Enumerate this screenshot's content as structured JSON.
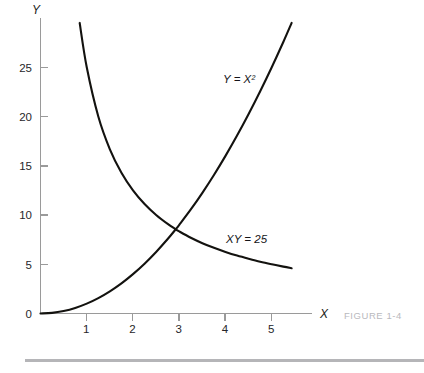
{
  "caption": "FIGURE 1-4",
  "axes": {
    "x_name": "X",
    "y_name": "Y",
    "x_ticks": [
      "1",
      "2",
      "3",
      "4",
      "5"
    ],
    "y_ticks": [
      "0",
      "5",
      "10",
      "15",
      "20",
      "25"
    ]
  },
  "annotations": {
    "parabola_label": "Y = X²",
    "hyperbola_label": "XY = 25"
  },
  "colors": {
    "curve": "#13120f",
    "axis": "#9a9a9a",
    "caption": "#b9b9bd",
    "rule": "#b5b5b8",
    "background": "#ffffff"
  },
  "chart_data": {
    "type": "line",
    "title": "",
    "subtitle": "",
    "xlabel": "X",
    "ylabel": "Y",
    "xlim": [
      0,
      5.9
    ],
    "ylim": [
      0,
      30
    ],
    "grid": false,
    "legend": "inline-annotations",
    "xticks": [
      1,
      2,
      3,
      4,
      5
    ],
    "yticks": [
      0,
      5,
      10,
      15,
      20,
      25
    ],
    "annotations": [
      {
        "text": "Y = X²",
        "x": 3.95,
        "y": 25.0
      },
      {
        "text": "XY = 25",
        "x": 4.05,
        "y": 7.4
      }
    ],
    "intersection": {
      "x": 2.924,
      "y": 8.55
    },
    "series": [
      {
        "name": "Y = X²",
        "equation": "y = x^2",
        "x_range": [
          0.0,
          5.43
        ],
        "points": [
          {
            "x": 0.0,
            "y": 0.0
          },
          {
            "x": 0.25,
            "y": 0.06
          },
          {
            "x": 0.5,
            "y": 0.25
          },
          {
            "x": 0.75,
            "y": 0.56
          },
          {
            "x": 1.0,
            "y": 1.0
          },
          {
            "x": 1.25,
            "y": 1.56
          },
          {
            "x": 1.5,
            "y": 2.25
          },
          {
            "x": 1.75,
            "y": 3.06
          },
          {
            "x": 2.0,
            "y": 4.0
          },
          {
            "x": 2.25,
            "y": 5.06
          },
          {
            "x": 2.5,
            "y": 6.25
          },
          {
            "x": 2.75,
            "y": 7.56
          },
          {
            "x": 2.924,
            "y": 8.55
          },
          {
            "x": 3.0,
            "y": 9.0
          },
          {
            "x": 3.25,
            "y": 10.56
          },
          {
            "x": 3.5,
            "y": 12.25
          },
          {
            "x": 3.75,
            "y": 14.06
          },
          {
            "x": 4.0,
            "y": 16.0
          },
          {
            "x": 4.25,
            "y": 18.06
          },
          {
            "x": 4.5,
            "y": 20.25
          },
          {
            "x": 4.75,
            "y": 22.56
          },
          {
            "x": 5.0,
            "y": 25.0
          },
          {
            "x": 5.25,
            "y": 27.56
          },
          {
            "x": 5.43,
            "y": 29.5
          }
        ]
      },
      {
        "name": "XY = 25",
        "equation": "y = 25 / x",
        "x_range": [
          0.847,
          5.43
        ],
        "points": [
          {
            "x": 0.847,
            "y": 29.5
          },
          {
            "x": 1.0,
            "y": 25.0
          },
          {
            "x": 1.25,
            "y": 20.0
          },
          {
            "x": 1.5,
            "y": 16.67
          },
          {
            "x": 1.75,
            "y": 14.29
          },
          {
            "x": 2.0,
            "y": 12.5
          },
          {
            "x": 2.25,
            "y": 11.11
          },
          {
            "x": 2.5,
            "y": 10.0
          },
          {
            "x": 2.75,
            "y": 9.09
          },
          {
            "x": 2.924,
            "y": 8.55
          },
          {
            "x": 3.0,
            "y": 8.33
          },
          {
            "x": 3.25,
            "y": 7.69
          },
          {
            "x": 3.5,
            "y": 7.14
          },
          {
            "x": 3.75,
            "y": 6.67
          },
          {
            "x": 4.0,
            "y": 6.25
          },
          {
            "x": 4.25,
            "y": 5.88
          },
          {
            "x": 4.5,
            "y": 5.56
          },
          {
            "x": 4.75,
            "y": 5.26
          },
          {
            "x": 5.0,
            "y": 5.0
          },
          {
            "x": 5.25,
            "y": 4.76
          },
          {
            "x": 5.43,
            "y": 4.6
          }
        ]
      }
    ]
  }
}
